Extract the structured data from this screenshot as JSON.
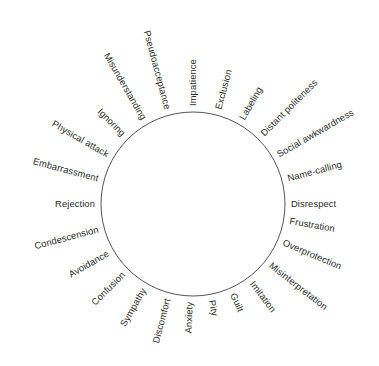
{
  "figure": {
    "type": "radial-label-circle",
    "title": "",
    "background_color": "#ffffff",
    "circle": {
      "stroke_color": "#555555",
      "stroke_width": 1,
      "center_x": 193,
      "center_y": 204,
      "radius": 92,
      "fill": "none"
    },
    "text_color": "#2b2b2b",
    "label_radius": 98,
    "label_count": 24,
    "angle_step_degrees": 15,
    "start_angle_degrees": 0,
    "direction": "counter-clockwise"
  },
  "chart_data": {
    "type": "pie",
    "title": "",
    "xlabel": "",
    "ylabel": "",
    "categories": [
      "Disrespect",
      "Name-calling",
      "Social awkwardness",
      "Distant politeness",
      "Labeling",
      "Exclusion",
      "Impatience",
      "Pseudoacceptance",
      "Misunderstanding",
      "Ignoring",
      "Physical attack",
      "Embarrassment",
      "Rejection",
      "Condescension",
      "Avoidance",
      "Confusion",
      "Sympathy",
      "Discomfort",
      "Anxiety",
      "Pity",
      "Guilt",
      "Imitation",
      "Misinterpretation",
      "Overprotection",
      "Frustration"
    ],
    "values": [
      1,
      1,
      1,
      1,
      1,
      1,
      1,
      1,
      1,
      1,
      1,
      1,
      1,
      1,
      1,
      1,
      1,
      1,
      1,
      1,
      1,
      1,
      1,
      1,
      1
    ],
    "legend": "none",
    "grid": false
  },
  "labels": [
    {
      "text": "Disrespect",
      "angle": 0
    },
    {
      "text": "Name-calling",
      "angle": 15
    },
    {
      "text": "Social awkwardness",
      "angle": 30
    },
    {
      "text": "Distant politeness",
      "angle": 45
    },
    {
      "text": "Labeling",
      "angle": 60
    },
    {
      "text": "Exclusion",
      "angle": 75
    },
    {
      "text": "Impatience",
      "angle": 90
    },
    {
      "text": "Pseudoacceptance",
      "angle": 105
    },
    {
      "text": "Misunderstanding",
      "angle": 120
    },
    {
      "text": "Ignoring",
      "angle": 135
    },
    {
      "text": "Physical attack",
      "angle": 150
    },
    {
      "text": "Embarrassment",
      "angle": 165
    },
    {
      "text": "Rejection",
      "angle": 180
    },
    {
      "text": "Condescension",
      "angle": 195
    },
    {
      "text": "Avoidance",
      "angle": 210
    },
    {
      "text": "Confusion",
      "angle": 225
    },
    {
      "text": "Sympathy",
      "angle": 240
    },
    {
      "text": "Discomfort",
      "angle": 255
    },
    {
      "text": "Anxiety",
      "angle": 268
    },
    {
      "text": "Pity",
      "angle": 281
    },
    {
      "text": "Guilt",
      "angle": 294
    },
    {
      "text": "Imitation",
      "angle": 307
    },
    {
      "text": "Misinterpretation",
      "angle": 322
    },
    {
      "text": "Overprotection",
      "angle": 337
    },
    {
      "text": "Frustration",
      "angle": 350
    }
  ]
}
